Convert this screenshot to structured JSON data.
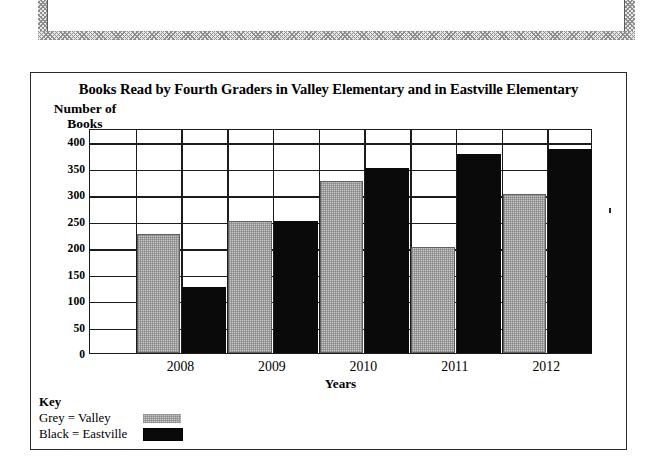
{
  "instruction": {
    "line_clipped": " ",
    "line_2": "bar graphs figure out the answer."
  },
  "chart_data": {
    "type": "bar",
    "title": "Books Read by Fourth Graders in Valley Elementary and in Eastville Elementary",
    "xlabel": "Years",
    "ylabel": "Number of Books",
    "ylabel_line1": "Number of",
    "ylabel_line2": "Books",
    "categories": [
      "2008",
      "2009",
      "2010",
      "2011",
      "2012"
    ],
    "yticks": [
      400,
      350,
      300,
      250,
      200,
      150,
      100,
      50,
      0
    ],
    "ylim": [
      0,
      425
    ],
    "grid": true,
    "legend_position": "below-left",
    "series": [
      {
        "name": "Valley",
        "key_label": "Grey = Valley",
        "color": "#c9c9c9",
        "values": [
          225,
          250,
          325,
          200,
          300
        ]
      },
      {
        "name": "Eastville",
        "key_label": "Black = Eastville",
        "color": "#0a0a0a",
        "values": [
          125,
          250,
          350,
          375,
          385
        ]
      }
    ]
  },
  "key": {
    "heading": "Key",
    "rows": [
      {
        "label": "Grey = Valley",
        "swatch": "grey"
      },
      {
        "label": "Black = Eastville",
        "swatch": "black"
      }
    ]
  }
}
